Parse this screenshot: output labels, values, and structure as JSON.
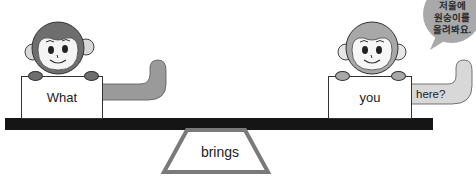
{
  "speech_bubble": {
    "lines": [
      "저울에",
      "원숭이를",
      "올려봐요."
    ],
    "fill": "#a9a9a9"
  },
  "left_monkey": {
    "card_label": "What",
    "face_color": "#6e6e6e"
  },
  "right_monkey": {
    "card_label": "you",
    "tail_label": "here?",
    "face_color": "#a8a8a8"
  },
  "fulcrum": {
    "label": "brings",
    "border_color": "#7a7a7a"
  },
  "plank": {
    "color": "#151515"
  }
}
